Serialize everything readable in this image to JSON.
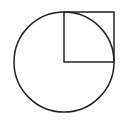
{
  "diagram": {
    "canvas": {
      "width": 126,
      "height": 124,
      "background": "#ffffff"
    },
    "stroke_color": "#222222",
    "stroke_width": 1.5,
    "circle": {
      "cx": 64,
      "cy": 62,
      "r": 50
    },
    "square": {
      "x": 64,
      "y": 12,
      "size": 50
    }
  }
}
